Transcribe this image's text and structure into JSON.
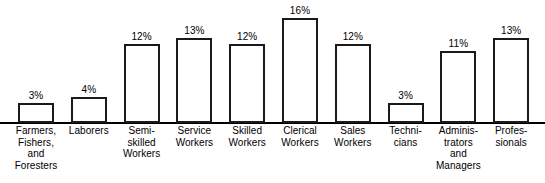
{
  "chart_data": {
    "type": "bar",
    "title": "",
    "subtitle": "",
    "xlabel": "",
    "ylabel": "",
    "ylim": [
      0,
      16
    ],
    "grid": false,
    "legend": "none",
    "axis": "baseline-only",
    "value_suffix": "%",
    "categories": [
      "Farmers, Fishers, and Foresters",
      "Laborers",
      "Semi-skilled Workers",
      "Service Workers",
      "Skilled Workers",
      "Clerical Workers",
      "Sales Workers",
      "Technicians",
      "Administrators and Managers",
      "Professionals"
    ],
    "category_lines": [
      [
        "Farmers,",
        "Fishers,",
        "and",
        "Foresters"
      ],
      [
        "Laborers"
      ],
      [
        "Semi-",
        "skilled",
        "Workers"
      ],
      [
        "Service",
        "Workers"
      ],
      [
        "Skilled",
        "Workers"
      ],
      [
        "Clerical",
        "Workers"
      ],
      [
        "Sales",
        "Workers"
      ],
      [
        "Techni-",
        "cians"
      ],
      [
        "Adminis-",
        "trators",
        "and",
        "Managers"
      ],
      [
        "Profes-",
        "sionals"
      ]
    ],
    "values": [
      3,
      4,
      12,
      13,
      12,
      16,
      12,
      3,
      11,
      13
    ],
    "value_labels": [
      "3%",
      "4%",
      "12%",
      "13%",
      "12%",
      "16%",
      "12%",
      "3%",
      "11%",
      "13%"
    ],
    "colors": {
      "bar_fill": "#ffffff",
      "bar_stroke": "#1a1a1a",
      "axis": "#000000",
      "text": "#000000",
      "background": "#ffffff"
    }
  }
}
